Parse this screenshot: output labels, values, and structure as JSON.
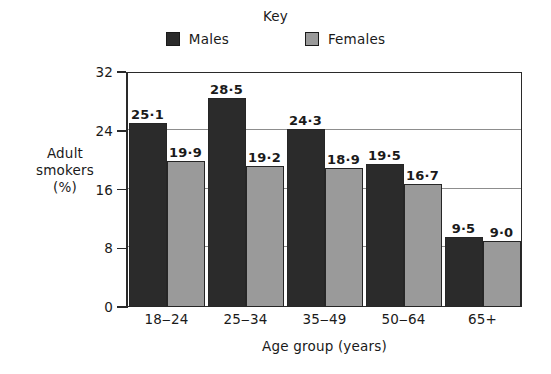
{
  "chart_data": {
    "type": "bar",
    "title": "",
    "legend_title": "Key",
    "legend_position": "top-center",
    "categories": [
      "18‒24",
      "25‒34",
      "35‒49",
      "50‒64",
      "65+"
    ],
    "series": [
      {
        "name": "Males",
        "color": "#2b2b2b",
        "values": [
          25.1,
          28.5,
          24.3,
          19.5,
          9.5
        ],
        "labels": [
          "25·1",
          "28·5",
          "24·3",
          "19·5",
          "9·5"
        ]
      },
      {
        "name": "Females",
        "color": "#9a9a9a",
        "values": [
          19.9,
          19.2,
          18.9,
          16.7,
          9.0
        ],
        "labels": [
          "19·9",
          "19·2",
          "18·9",
          "16·7",
          "9·0"
        ]
      }
    ],
    "xlabel": "Age group (years)",
    "ylabel": "Adult smokers (%)",
    "ylabel_lines": [
      "Adult",
      "smokers",
      "(%)"
    ],
    "ylim": [
      0,
      32
    ],
    "yticks": [
      0,
      8,
      16,
      24,
      32
    ],
    "ytick_labels": [
      "0",
      "8",
      "16",
      "24",
      "32"
    ],
    "grid": "horizontal",
    "gridline_values": [
      8,
      16,
      24
    ],
    "grid_color": "#8d8d8d",
    "frame_color": "#2a2a2a"
  }
}
